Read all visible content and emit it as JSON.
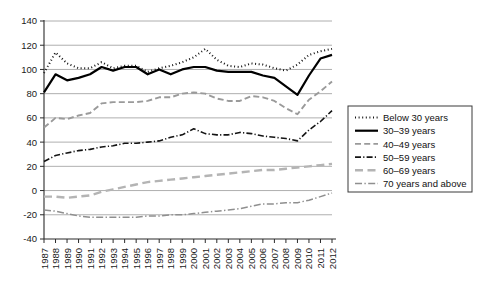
{
  "chart_data": {
    "type": "line",
    "title": "",
    "subtitle": "",
    "xlabel": "",
    "ylabel": "",
    "grid": true,
    "legend_position": "right",
    "xlim": [
      1987,
      2012
    ],
    "ylim": [
      -40,
      140
    ],
    "yticks": [
      -40,
      -20,
      0,
      20,
      40,
      60,
      80,
      100,
      120,
      140
    ],
    "ytick_labels": [
      "-40",
      "-20",
      "0",
      "20",
      "40",
      "60",
      "80",
      "100",
      "120",
      "140"
    ],
    "x": [
      1987,
      1988,
      1989,
      1990,
      1991,
      1992,
      1993,
      1994,
      1995,
      1996,
      1997,
      1998,
      1999,
      2000,
      2001,
      2002,
      2003,
      2004,
      2005,
      2006,
      2007,
      2008,
      2009,
      2010,
      2011,
      2012
    ],
    "categories": [
      "1987",
      "1988",
      "1989",
      "1990",
      "1991",
      "1992",
      "1993",
      "1994",
      "1995",
      "1996",
      "1997",
      "1998",
      "1999",
      "2000",
      "2001",
      "2002",
      "2003",
      "2004",
      "2005",
      "2006",
      "2007",
      "2008",
      "2009",
      "2010",
      "2011",
      "2012"
    ],
    "series": [
      {
        "name": "Below 30 years",
        "key": "below30",
        "style": "dotted",
        "color": "#141414",
        "width": 2.0,
        "dash": "1,2.6",
        "values": [
          97,
          114,
          105,
          101,
          101,
          106,
          101,
          103,
          103,
          98,
          101,
          103,
          106,
          110,
          117,
          108,
          103,
          102,
          105,
          104,
          101,
          99,
          104,
          112,
          115,
          117
        ]
      },
      {
        "name": "30–39 years",
        "key": "age3039",
        "style": "solid",
        "color": "#000000",
        "width": 2.2,
        "dash": "",
        "values": [
          81,
          96,
          91,
          93,
          96,
          102,
          99,
          102,
          102,
          96,
          100,
          96,
          100,
          102,
          102,
          99,
          98,
          98,
          98,
          95,
          93,
          86,
          79,
          95,
          109,
          112
        ]
      },
      {
        "name": "40–49 years",
        "key": "age4049",
        "style": "dashed",
        "color": "#9a9a9a",
        "width": 1.9,
        "dash": "6,3.2",
        "values": [
          52,
          60,
          59,
          62,
          64,
          72,
          73,
          73,
          73,
          74,
          77,
          77,
          80,
          81,
          80,
          76,
          74,
          74,
          78,
          77,
          74,
          68,
          63,
          75,
          82,
          90
        ]
      },
      {
        "name": "50–59 years",
        "key": "age5059",
        "style": "dashdot",
        "color": "#141414",
        "width": 1.6,
        "dash": "6,2.2,1.2,2.2",
        "values": [
          24,
          29,
          31,
          33,
          34,
          36,
          37,
          39,
          39,
          40,
          41,
          44,
          46,
          51,
          47,
          46,
          46,
          48,
          47,
          45,
          44,
          43,
          41,
          50,
          57,
          66
        ]
      },
      {
        "name": "60–69 years",
        "key": "age6069",
        "style": "longdash",
        "color": "#b4b4b4",
        "width": 2.4,
        "dash": "8,4.5",
        "values": [
          -5,
          -5,
          -6,
          -5,
          -4,
          -1,
          1,
          3,
          5,
          7,
          8,
          9,
          10,
          11,
          12,
          13,
          14,
          15,
          16,
          17,
          17,
          18,
          19,
          20,
          21,
          22
        ]
      },
      {
        "name": "70 years and above",
        "key": "age70plus",
        "style": "dashdot",
        "color": "#8f8f8f",
        "width": 1.5,
        "dash": "7,2.4,1.4,2.4",
        "values": [
          -16,
          -17,
          -19,
          -21,
          -22,
          -22,
          -22,
          -22,
          -22,
          -21,
          -21,
          -20,
          -20,
          -19,
          -18,
          -17,
          -16,
          -15,
          -13,
          -11,
          -11,
          -10,
          -10,
          -8,
          -5,
          -2
        ]
      }
    ],
    "legend_entries": [
      "Below 30 years",
      "30–39 years",
      "40–49 years",
      "50–59 years",
      "60–69 years",
      "70 years and above"
    ]
  }
}
